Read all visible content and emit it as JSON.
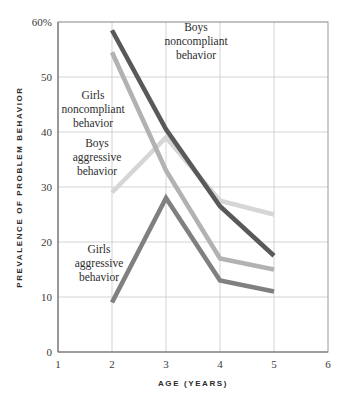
{
  "chart_data": {
    "type": "line",
    "title": "",
    "xlabel": "AGE (YEARS)",
    "ylabel": "PREVALENCE OF PROBLEM BEHAVIOR",
    "xlim": [
      1,
      6
    ],
    "ylim": [
      0,
      60
    ],
    "grid": true,
    "legend_position": "inline-annotations",
    "x": [
      2,
      3,
      4,
      5
    ],
    "xticks": [
      "1",
      "2",
      "3",
      "4",
      "5",
      "6"
    ],
    "yticks": [
      "0",
      "10",
      "20",
      "30",
      "40",
      "50",
      "60%"
    ],
    "ytick_values": [
      0,
      10,
      20,
      30,
      40,
      50,
      60
    ],
    "series": [
      {
        "name": "Boys noncompliant behavior",
        "label_lines": [
          "Boys",
          "noncompliant",
          "behavior"
        ],
        "color": "#595959",
        "values": [
          58.5,
          40.5,
          26.5,
          17.5
        ]
      },
      {
        "name": "Girls noncompliant behavior",
        "label_lines": [
          "Girls",
          "noncompliant",
          "behavior"
        ],
        "color": "#b2b2b2",
        "values": [
          54.5,
          33,
          17,
          15
        ]
      },
      {
        "name": "Boys aggressive behavior",
        "label_lines": [
          "Boys",
          "aggressive",
          "behavior"
        ],
        "color": "#d6d6d6",
        "values": [
          29,
          39,
          27.5,
          25
        ]
      },
      {
        "name": "Girls aggressive behavior",
        "label_lines": [
          "Girls",
          "aggressive",
          "behavior"
        ],
        "color": "#808080",
        "values": [
          9,
          28,
          13,
          11
        ]
      }
    ]
  },
  "axes": {
    "x_title": "AGE (YEARS)",
    "y_title": "PREVALENCE OF PROBLEM BEHAVIOR",
    "x_ticks": [
      "1",
      "2",
      "3",
      "4",
      "5",
      "6"
    ],
    "y_ticks": [
      "0",
      "10",
      "20",
      "30",
      "40",
      "50",
      "60%"
    ]
  },
  "annotations": {
    "boys_noncompliant": {
      "line1": "Boys",
      "line2": "noncompliant",
      "line3": "behavior"
    },
    "girls_noncompliant": {
      "line1": "Girls",
      "line2": "noncompliant",
      "line3": "behavior"
    },
    "boys_aggressive": {
      "line1": "Boys",
      "line2": "aggressive",
      "line3": "behavior"
    },
    "girls_aggressive": {
      "line1": "Girls",
      "line2": "aggressive",
      "line3": "behavior"
    }
  },
  "colors": {
    "boys_noncompliant": "#595959",
    "girls_noncompliant": "#b2b2b2",
    "boys_aggressive": "#d6d6d6",
    "girls_aggressive": "#808080",
    "gridline": "#c8c8c8",
    "frame": "#9a9a9a",
    "text": "#2b2b2b",
    "background": "#ffffff"
  }
}
